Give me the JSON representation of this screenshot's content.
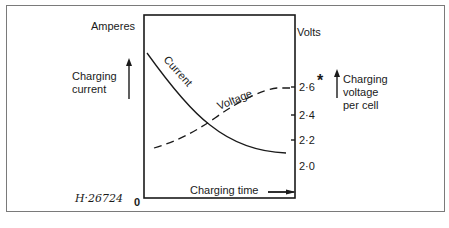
{
  "diagram": {
    "left_axis": {
      "unit": "Amperes",
      "label_line1": "Charging",
      "label_line2": "current",
      "origin": "0"
    },
    "right_axis": {
      "unit": "Volts",
      "label_line1": "Charging",
      "label_line2": "voltage",
      "label_line3": "per cell",
      "ticks": [
        "2·6",
        "2·4",
        "2·2",
        "2·0"
      ],
      "asterisk": "*"
    },
    "x_axis": {
      "label": "Charging time"
    },
    "curves": {
      "current_label": "Current",
      "voltage_label": "Voltage"
    },
    "reference": "H·26724"
  },
  "colors": {
    "ink": "#1a1a1a",
    "frame": "#7a7a7a",
    "background": "#ffffff"
  }
}
